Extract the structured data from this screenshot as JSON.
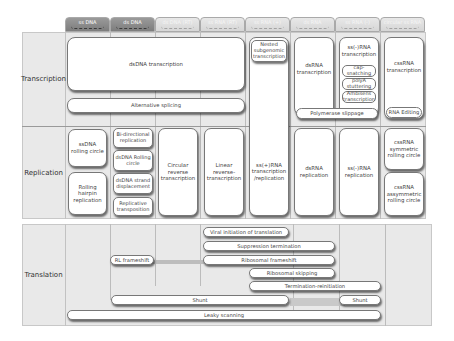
{
  "header": {
    "tabs": [
      {
        "label": "ss DNA",
        "style": "dark"
      },
      {
        "label": "ds DNA",
        "style": "dark"
      },
      {
        "label": "ds DNA (RT)",
        "style": "light"
      },
      {
        "label": "ss RNA (RT)",
        "style": "light"
      },
      {
        "label": "ss RNA (+)",
        "style": "light"
      },
      {
        "label": "ds RNA",
        "style": "light"
      },
      {
        "label": "ss RNA (-)",
        "style": "light"
      },
      {
        "label": "circular ss RNA",
        "style": "light"
      }
    ]
  },
  "rows": {
    "transcription": {
      "label": "Transcription",
      "boxes": {
        "dsdna_transcription": "dsDNA transcription",
        "alternative_splicing": "Alternative splicing",
        "nested_subgenomic": "Nested subgenomic transcription",
        "ss_plus_rna_transcription_replication": "ss(+)RNA transcription /replication",
        "dsrna_transcription": "dsRNA transcription",
        "ss_minus_rna_transcription": "ss(-)RNA transcription",
        "cap_snatching": "cap-snatching",
        "polya_stuttering": "polyA stuttering",
        "ambisense_transcription": "Ambisens transcription",
        "polymerase_slippage": "Polymerase slippage",
        "cssrna_transcription": "cssRNA transcription",
        "rna_editing": "RNA Editing"
      }
    },
    "replication": {
      "label": "Replication",
      "boxes": {
        "ssdna_rolling_circle": "ssDNA rolling circle",
        "rolling_hairpin": "Rolling hairpin replication",
        "bidirectional_replication": "Bi-directional replication",
        "dsdna_rolling_circle": "dsDNA Rolling circle",
        "dsdna_strand_displacement": "dsDNA strand displacement",
        "replicative_transposition": "Replicative transposition",
        "circular_reverse_transcription": "Circular reverse transcription",
        "linear_reverse_transcription": "Linear reverse-transcription",
        "dsrna_replication": "dsRNA replication",
        "ss_minus_rna_replication": "ss(-)RNA replication",
        "cssrna_symmetric": "cssRNA symmetric rolling circle",
        "cssrna_asymmetric": "cssRNA assymmetric rolling circle"
      }
    },
    "translation": {
      "label": "Translation",
      "bars": {
        "viral_initiation": "Viral initiation of translation",
        "suppression_termination": "Suppression termination",
        "rl_frameshift": "RL frameshift",
        "ribosomal_frameshift": "Ribosomal frameshift",
        "ribosomal_skipping": "Ribosomal skipping",
        "termination_reinitiation": "Termination-reinitiation",
        "shunt_left": "Shunt",
        "shunt_right": "Shunt",
        "leaky_scanning": "Leaky scanning"
      }
    }
  }
}
